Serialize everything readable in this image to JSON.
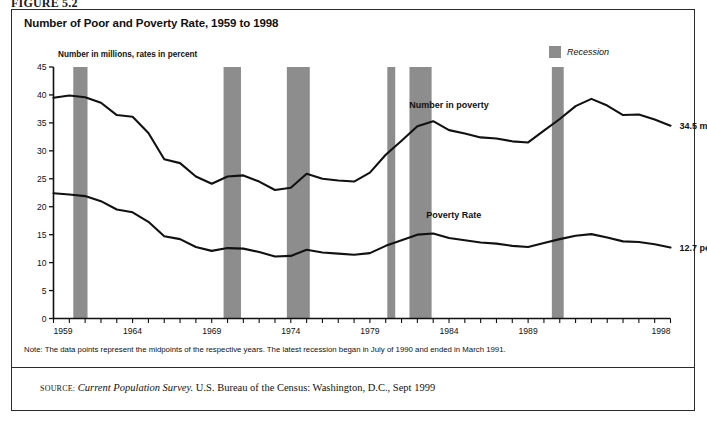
{
  "figure": {
    "label": "FIGURE 5.2"
  },
  "chart_title": "Number of Poor and Poverty Rate, 1959 to 1998",
  "y_caption": "Number in millions, rates in percent",
  "legend": {
    "recession_label": "Recession",
    "swatch_color": "#8d8d8d"
  },
  "series_labels": {
    "number_in_poverty": "Number in poverty",
    "poverty_rate": "Poverty Rate"
  },
  "end_labels": {
    "number_in_poverty": "34.5 million",
    "poverty_rate": "12.7 percent"
  },
  "note": "Note: The data points represent the midpoints of the respective years. The latest recession began in July of 1990 and ended in March 1991.",
  "source": {
    "key": "SOURCE:",
    "title": "Current Population Survey.",
    "rest": " U.S. Bureau of the Census: Washington, D.C., Sept 1999"
  },
  "chart_data": {
    "type": "line",
    "title": "Number of Poor and Poverty Rate, 1959 to 1998",
    "xlabel": "",
    "ylabel": "Number in millions, rates in percent",
    "xlim": [
      1959,
      1998
    ],
    "ylim": [
      0,
      45
    ],
    "ytick_step": 5,
    "yticks": [
      0,
      5,
      10,
      15,
      20,
      25,
      30,
      35,
      40,
      45
    ],
    "xticks_labeled": [
      1959,
      1964,
      1969,
      1974,
      1979,
      1984,
      1989,
      1998
    ],
    "xticks_all_years": true,
    "grid": false,
    "legend_position": "top-right",
    "x": [
      1959,
      1960,
      1961,
      1962,
      1963,
      1964,
      1965,
      1966,
      1967,
      1968,
      1969,
      1970,
      1971,
      1972,
      1973,
      1974,
      1975,
      1976,
      1977,
      1978,
      1979,
      1980,
      1981,
      1982,
      1983,
      1984,
      1985,
      1986,
      1987,
      1988,
      1989,
      1990,
      1991,
      1992,
      1993,
      1994,
      1995,
      1996,
      1997,
      1998
    ],
    "series": [
      {
        "name": "Number in poverty",
        "unit": "millions",
        "color": "#111111",
        "values": [
          39.5,
          39.9,
          39.6,
          38.6,
          36.4,
          36.1,
          33.2,
          28.5,
          27.8,
          25.4,
          24.1,
          25.4,
          25.6,
          24.5,
          23.0,
          23.4,
          25.9,
          25.0,
          24.7,
          24.5,
          26.1,
          29.3,
          31.8,
          34.4,
          35.3,
          33.7,
          33.1,
          32.4,
          32.2,
          31.7,
          31.5,
          33.6,
          35.7,
          38.0,
          39.3,
          38.1,
          36.4,
          36.5,
          35.6,
          34.5
        ]
      },
      {
        "name": "Poverty Rate",
        "unit": "percent",
        "color": "#111111",
        "values": [
          22.4,
          22.2,
          21.9,
          21.0,
          19.5,
          19.0,
          17.3,
          14.7,
          14.2,
          12.8,
          12.1,
          12.6,
          12.5,
          11.9,
          11.1,
          11.2,
          12.3,
          11.8,
          11.6,
          11.4,
          11.7,
          13.0,
          14.0,
          15.0,
          15.2,
          14.4,
          14.0,
          13.6,
          13.4,
          13.0,
          12.8,
          13.5,
          14.2,
          14.8,
          15.1,
          14.5,
          13.8,
          13.7,
          13.3,
          12.7
        ]
      }
    ],
    "recession_bands": [
      {
        "start": 1960.25,
        "end": 1961.15
      },
      {
        "start": 1969.75,
        "end": 1970.85
      },
      {
        "start": 1973.75,
        "end": 1975.2
      },
      {
        "start": 1980.1,
        "end": 1980.6
      },
      {
        "start": 1981.5,
        "end": 1982.9
      },
      {
        "start": 1990.5,
        "end": 1991.25
      }
    ]
  }
}
